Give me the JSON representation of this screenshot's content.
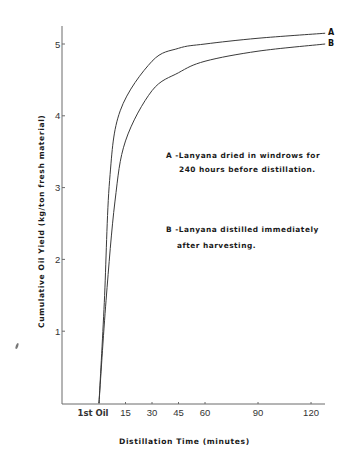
{
  "chart_data": {
    "type": "line",
    "title": "",
    "xlabel": "Distillation Time (minutes)",
    "ylabel": "Cumulative Oil Yield (kg/ton fresh material)",
    "x_tick_labels": [
      "1st Oil",
      "15",
      "30",
      "45",
      "60",
      "90",
      "120"
    ],
    "x_ticks": [
      0,
      15,
      30,
      45,
      60,
      90,
      120
    ],
    "y_tick_labels": [
      "1",
      "2",
      "3",
      "4",
      "5"
    ],
    "y_ticks": [
      1,
      2,
      3,
      4,
      5
    ],
    "xlim": [
      -21,
      128
    ],
    "ylim": [
      0,
      5.3
    ],
    "grid": false,
    "legend_position": "inside, center-right (text annotations)",
    "series": [
      {
        "name": "A",
        "description": "A -Lanyana dried in windrows for 240 hours before distillation.",
        "x": [
          0,
          3,
          6,
          12,
          30,
          45,
          60,
          90,
          128
        ],
        "values": [
          0,
          1.4,
          3.1,
          4.07,
          4.76,
          4.94,
          5.0,
          5.08,
          5.15
        ]
      },
      {
        "name": "B",
        "description": "B -Lanyana distilled immediately after harvesting.",
        "x": [
          0,
          4,
          9,
          15,
          30,
          45,
          60,
          90,
          128
        ],
        "values": [
          0,
          1.43,
          2.8,
          3.65,
          4.35,
          4.6,
          4.76,
          4.9,
          5.0
        ]
      }
    ],
    "annotations": [
      "A -Lanyana dried in windrows for",
      "240 hours before distillation.",
      "B -Lanyana distilled immediately",
      "after harvesting."
    ]
  },
  "labels": {
    "xlabel": "Distillation Time (minutes)",
    "ylabel": "Cumulative Oil Yield (kg/ton fresh material)",
    "curve_a": "A",
    "curve_b": "B",
    "legend_a_line1": "A -Lanyana dried in windrows for",
    "legend_a_line2": "240 hours before distillation.",
    "legend_b_line1": "B -Lanyana distilled immediately",
    "legend_b_line2": "after harvesting."
  },
  "colors": {
    "axis": "#6b6b6b",
    "curve": "#3a3a3a",
    "text": "#1a1a1a"
  }
}
